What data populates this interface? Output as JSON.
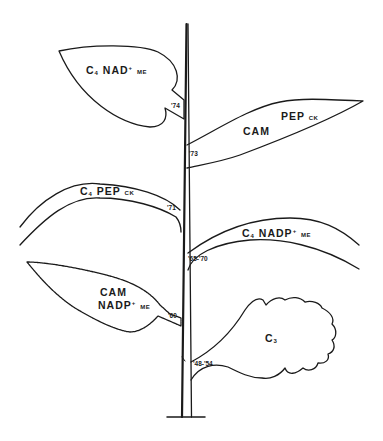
{
  "diagram": {
    "type": "evolutionary-tree-plant-illustration",
    "stroke_color": "#1a1a1a",
    "background": "#ffffff",
    "leaves": [
      {
        "id": "c4-nad-me",
        "main": "C",
        "sub": "4",
        "name": "NAD",
        "sup": "+",
        "suffix": "ME",
        "year": "'74"
      },
      {
        "id": "cam-pep-ck",
        "main": "CAM",
        "name": "PEP",
        "suffix": "CK",
        "year": "'73"
      },
      {
        "id": "c4-pep-ck",
        "main": "C",
        "sub": "4",
        "name": "PEP",
        "suffix": "CK",
        "year": "'71"
      },
      {
        "id": "c4-nadp-me",
        "main": "C",
        "sub": "4",
        "name": "NADP",
        "sup": "+",
        "suffix": "ME",
        "year": "'65-'70"
      },
      {
        "id": "cam-nadp-me",
        "main": "CAM",
        "name": "NADP",
        "sup": "+",
        "suffix": "ME",
        "year": "'60"
      },
      {
        "id": "c3",
        "main": "C",
        "sub": "3",
        "year": "'48-'54"
      }
    ]
  }
}
